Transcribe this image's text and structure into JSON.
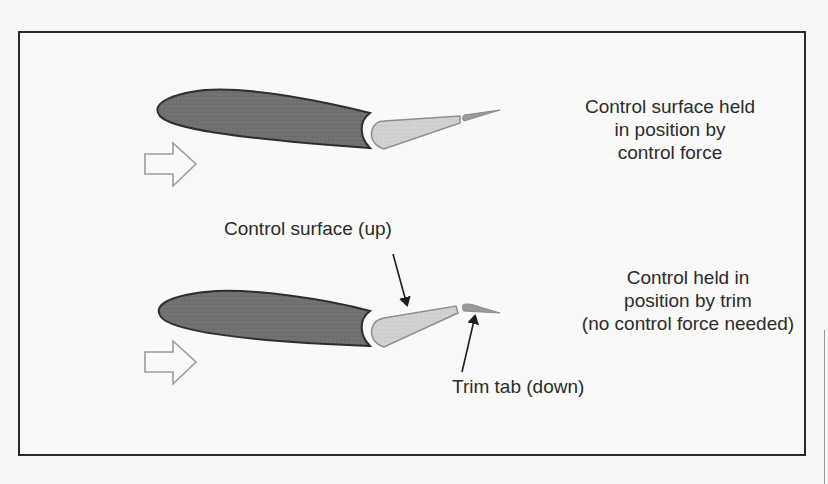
{
  "diagram": {
    "colors": {
      "main_airfoil_fill": "#6e6e6e",
      "main_airfoil_stroke": "#2e2e2e",
      "control_surface_fill": "#cfcfcf",
      "control_surface_stroke": "#8c8c8c",
      "trim_tab_fill": "#9a9a9a",
      "airflow_arrow_stroke": "#9c9c9c",
      "frame": "#2a2a2a",
      "text": "#2b2b2b"
    },
    "panels": [
      {
        "id": "top",
        "airflow_icon": "hollow-right-arrow",
        "label": {
          "lines": [
            "Control surface held",
            "in position by",
            "control force"
          ]
        }
      },
      {
        "id": "bottom",
        "airflow_icon": "hollow-right-arrow",
        "label": {
          "lines": [
            "Control held in",
            "position by trim",
            "(no control force needed)"
          ]
        },
        "callouts": {
          "control_surface": "Control surface (up)",
          "trim_tab": "Trim tab (down)"
        }
      }
    ]
  }
}
